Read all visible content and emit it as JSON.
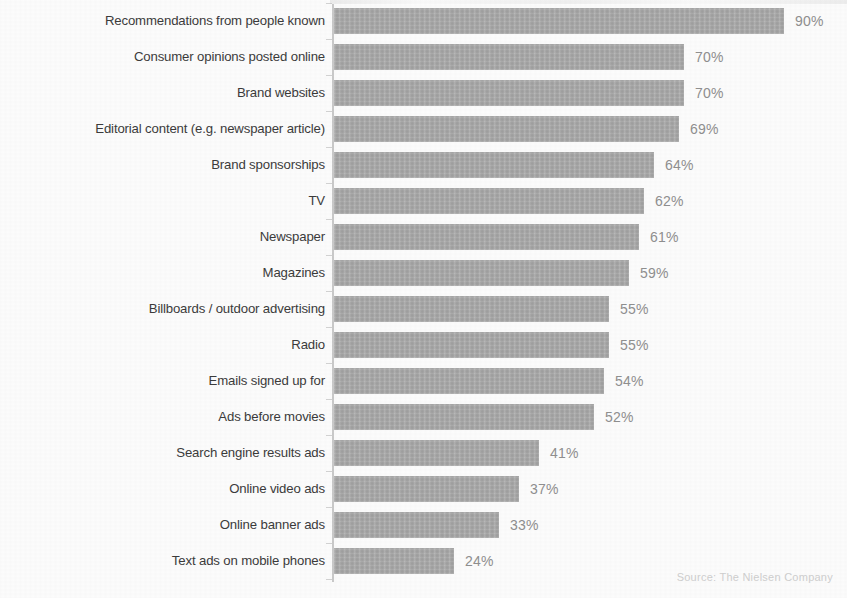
{
  "chart_data": {
    "type": "bar",
    "orientation": "horizontal",
    "title": "",
    "subtitle": "",
    "xlabel": "",
    "ylabel": "",
    "xlim": [
      0,
      100
    ],
    "grid": false,
    "legend": null,
    "value_suffix": "%",
    "sorted": "descending",
    "categories": [
      "Recommendations from people known",
      "Consumer opinions posted online",
      "Brand websites",
      "Editorial content (e.g. newspaper article)",
      "Brand sponsorships",
      "TV",
      "Newspaper",
      "Magazines",
      "Billboards / outdoor advertising",
      "Radio",
      "Emails signed up for",
      "Ads before movies",
      "Search engine results ads",
      "Online video ads",
      "Online banner ads",
      "Text ads on mobile phones"
    ],
    "values": [
      90,
      70,
      70,
      69,
      64,
      62,
      61,
      59,
      55,
      55,
      54,
      52,
      41,
      37,
      33,
      24
    ],
    "value_labels": [
      "90%",
      "70%",
      "70%",
      "69%",
      "64%",
      "62%",
      "61%",
      "59%",
      "55%",
      "55%",
      "54%",
      "52%",
      "41%",
      "37%",
      "33%",
      "24%"
    ]
  },
  "style": {
    "bar_color": "#a9a9a9",
    "axis_color": "#c9c9c9",
    "label_color": "#3b3b3b",
    "value_color": "#8f8f8f",
    "source_color": "#cfcfcf",
    "background": "#fcfcfc"
  },
  "footer": {
    "source": "Source: The Nielsen Company"
  }
}
